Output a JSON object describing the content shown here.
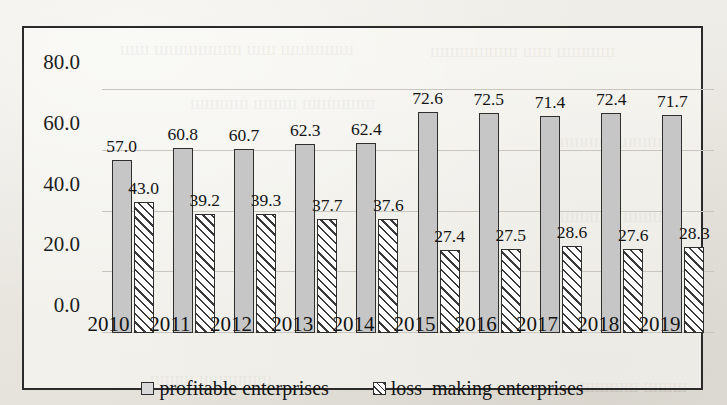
{
  "chart_data": {
    "type": "bar",
    "title": "",
    "xlabel": "",
    "ylabel": "",
    "ylim": [
      0,
      80
    ],
    "yticks": [
      "0.0",
      "20.0",
      "40.0",
      "60.0",
      "80.0"
    ],
    "ytick_values": [
      0,
      20,
      40,
      60,
      80
    ],
    "grid": true,
    "legend_position": "bottom",
    "categories": [
      "2010",
      "2011",
      "2012",
      "2013",
      "2014",
      "2015",
      "2016",
      "2017",
      "2018",
      "2019"
    ],
    "series": [
      {
        "name": "profitable enterprises",
        "style": "solid-gray",
        "values": [
          57.0,
          60.8,
          60.7,
          62.3,
          62.4,
          72.6,
          72.5,
          71.4,
          72.4,
          71.7
        ],
        "labels": [
          "57.0",
          "60.8",
          "60.7",
          "62.3",
          "62.4",
          "72.6",
          "72.5",
          "71.4",
          "72.4",
          "71.7"
        ]
      },
      {
        "name": "loss-making enterprises",
        "style": "diagonal-hatch",
        "values": [
          43.0,
          39.2,
          39.3,
          37.7,
          37.6,
          27.4,
          27.5,
          28.6,
          27.6,
          28.3
        ],
        "labels": [
          "43.0",
          "39.2",
          "39.3",
          "37.7",
          "37.6",
          "27.4",
          "27.5",
          "28.6",
          "27.6",
          "28.3"
        ]
      }
    ]
  },
  "legend": {
    "items": [
      {
        "label": "profitable enterprises",
        "swatch": "solid-gray-swatch"
      },
      {
        "label": "loss–making enterprises",
        "swatch": "hatched-swatch"
      }
    ]
  },
  "colors": {
    "solid_bar": "#c6c6c6",
    "hatch_line": "#3a3a3a",
    "bar_outline": "#2f2f2f",
    "gridline": "#c9c6bf",
    "frame": "#2b2b2b",
    "text": "#141414",
    "page_background": "#eceae4"
  },
  "ghost_text": [
    {
      "text": "шш шшшшшш шш шшшшш",
      "x": 120,
      "y": 38
    },
    {
      "text": "шшшшшш шш шшшш",
      "x": 430,
      "y": 40
    },
    {
      "text": "шшшш шшш шшшшш",
      "x": 190,
      "y": 92
    },
    {
      "text": "шшшшш шшш",
      "x": 540,
      "y": 130
    },
    {
      "text": "шшшш шшшш",
      "x": 560,
      "y": 205
    },
    {
      "text": "шшш шшшшш",
      "x": 150,
      "y": 368
    },
    {
      "text": "шшшш шшш",
      "x": 580,
      "y": 375
    }
  ]
}
